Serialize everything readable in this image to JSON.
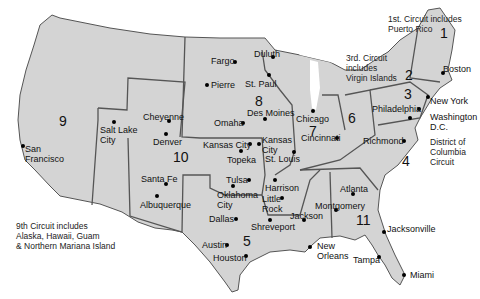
{
  "map": {
    "title": "U.S. Federal Courts of Appeals Circuits",
    "colors": {
      "land": "#d4d4d4",
      "circuit_border": "#555555",
      "state_border": "#9a9a9a",
      "water": "#ffffff"
    },
    "circuits": [
      {
        "id": "1",
        "label": "1",
        "x": 440,
        "y": 26
      },
      {
        "id": "2",
        "label": "2",
        "x": 405,
        "y": 68
      },
      {
        "id": "3",
        "label": "3",
        "x": 404,
        "y": 87
      },
      {
        "id": "4",
        "label": "4",
        "x": 402,
        "y": 154
      },
      {
        "id": "5",
        "label": "5",
        "x": 243,
        "y": 234
      },
      {
        "id": "6",
        "label": "6",
        "x": 348,
        "y": 111
      },
      {
        "id": "7",
        "label": "7",
        "x": 309,
        "y": 124
      },
      {
        "id": "8",
        "label": "8",
        "x": 255,
        "y": 94
      },
      {
        "id": "9",
        "label": "9",
        "x": 59,
        "y": 114
      },
      {
        "id": "10",
        "label": "10",
        "x": 173,
        "y": 150
      },
      {
        "id": "11",
        "label": "11",
        "x": 356,
        "y": 213
      },
      {
        "id": "dc",
        "label": "",
        "x": 0,
        "y": 0
      }
    ],
    "cities": [
      {
        "name": "Fargo",
        "dot": [
          235,
          62
        ],
        "label": [
          211,
          56
        ]
      },
      {
        "name": "Duluth",
        "dot": [
          273,
          57
        ],
        "label": [
          254,
          49
        ]
      },
      {
        "name": "Pierre",
        "dot": [
          207,
          85
        ],
        "label": [
          211,
          80
        ]
      },
      {
        "name": "St. Paul",
        "dot": [
          269,
          75
        ],
        "label": [
          245,
          79
        ]
      },
      {
        "name": "Cheyenne",
        "dot": [
          169,
          121
        ],
        "label": [
          143,
          112
        ]
      },
      {
        "name": "Salt Lake\nCity",
        "dot": [
          114,
          122
        ],
        "label": [
          100,
          125
        ]
      },
      {
        "name": "Denver",
        "dot": [
          166,
          134
        ],
        "label": [
          153,
          137
        ]
      },
      {
        "name": "Omaha",
        "dot": [
          243,
          123
        ],
        "label": [
          214,
          118
        ]
      },
      {
        "name": "Des Moines",
        "dot": [
          265,
          119
        ],
        "label": [
          247,
          108
        ]
      },
      {
        "name": "Kansas City",
        "dot": [
          250,
          144
        ],
        "label": [
          203,
          140
        ]
      },
      {
        "name": "Kansas\nCity",
        "dot": [
          259,
          144
        ],
        "label": [
          262,
          135
        ]
      },
      {
        "name": "Topeka",
        "dot": [
          241,
          151
        ],
        "label": [
          227,
          155
        ]
      },
      {
        "name": "St. Louis",
        "dot": [
          294,
          152
        ],
        "label": [
          265,
          154
        ]
      },
      {
        "name": "Chicago",
        "dot": [
          313,
          111
        ],
        "label": [
          296,
          114
        ]
      },
      {
        "name": "Cincinnati",
        "dot": [
          337,
          138
        ],
        "label": [
          301,
          133
        ]
      },
      {
        "name": "Philadelphia",
        "dot": [
          419,
          109
        ],
        "label": [
          372,
          104
        ]
      },
      {
        "name": "Washington\nD.C.",
        "dot": [
          410,
          118
        ],
        "label": [
          430,
          112
        ]
      },
      {
        "name": "New York",
        "dot": [
          428,
          97
        ],
        "label": [
          430,
          96
        ]
      },
      {
        "name": "Boston",
        "dot": [
          443,
          73
        ],
        "label": [
          443,
          64
        ]
      },
      {
        "name": "Richmond",
        "dot": [
          404,
          141
        ],
        "label": [
          363,
          136
        ]
      },
      {
        "name": "Santa Fe",
        "dot": [
          166,
          184
        ],
        "label": [
          141,
          174
        ]
      },
      {
        "name": "Albuquerque",
        "dot": [
          157,
          196
        ],
        "label": [
          140,
          200
        ]
      },
      {
        "name": "Tulsa",
        "dot": [
          249,
          180
        ],
        "label": [
          226,
          175
        ]
      },
      {
        "name": "Oklahoma\nCity",
        "dot": [
          233,
          186
        ],
        "label": [
          217,
          190
        ]
      },
      {
        "name": "Harrison",
        "dot": [
          275,
          180
        ],
        "label": [
          265,
          183
        ]
      },
      {
        "name": "Little\nRock",
        "dot": [
          282,
          198
        ],
        "label": [
          262,
          194
        ]
      },
      {
        "name": "Dallas",
        "dot": [
          236,
          219
        ],
        "label": [
          209,
          214
        ]
      },
      {
        "name": "Shreveport",
        "dot": [
          270,
          220
        ],
        "label": [
          251,
          222
        ]
      },
      {
        "name": "Jackson",
        "dot": [
          304,
          220
        ],
        "label": [
          290,
          211
        ]
      },
      {
        "name": "Montgomery",
        "dot": [
          336,
          210
        ],
        "label": [
          315,
          201
        ]
      },
      {
        "name": "Atlanta",
        "dot": [
          353,
          194
        ],
        "label": [
          340,
          184
        ]
      },
      {
        "name": "Austin",
        "dot": [
          227,
          245
        ],
        "label": [
          202,
          240
        ]
      },
      {
        "name": "Houston",
        "dot": [
          246,
          256
        ],
        "label": [
          213,
          253
        ]
      },
      {
        "name": "New\nOrleans",
        "dot": [
          310,
          247
        ],
        "label": [
          317,
          241
        ]
      },
      {
        "name": "Jacksonville",
        "dot": [
          384,
          232
        ],
        "label": [
          387,
          224
        ]
      },
      {
        "name": "Tampa",
        "dot": [
          379,
          257
        ],
        "label": [
          353,
          255
        ]
      },
      {
        "name": "Miami",
        "dot": [
          404,
          275
        ],
        "label": [
          410,
          270
        ]
      },
      {
        "name": "San\nFrancisco",
        "dot": [
          23,
          146
        ],
        "label": [
          25,
          144
        ]
      }
    ],
    "notes": {
      "first_circuit": "1st. Circuit includes\nPuerto Rico",
      "third_circuit": "3rd. Circuit\nincludes\nVirgin Islands",
      "dc_circuit": "District of\nColumbia\nCircuit",
      "ninth_circuit": "9th Circuit includes\nAlaska, Hawaii, Guam\n& Northern Mariana Island"
    }
  }
}
